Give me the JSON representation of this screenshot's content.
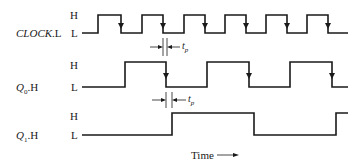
{
  "diagram": {
    "type": "timing-diagram",
    "signals": [
      {
        "name": "CLOCK.L",
        "name_italic": "CLOCK",
        "name_suffix": ".L",
        "high_label": "H",
        "low_label": "L",
        "edges_x": [
          98,
          121,
          142,
          163,
          184,
          205,
          225,
          246,
          266,
          287,
          307,
          328
        ],
        "start_level": "L"
      },
      {
        "name": "Q0.H",
        "name_italic": "Q",
        "name_sub": "0",
        "name_suffix": ".H",
        "high_label": "H",
        "low_label": "L",
        "edges_x": [
          125,
          166,
          207,
          249,
          290,
          332
        ],
        "start_level": "L"
      },
      {
        "name": "Q1.H",
        "name_italic": "Q",
        "name_sub": "1",
        "name_suffix": ".H",
        "high_label": "H",
        "low_label": "L",
        "edges_x": [
          172,
          254,
          336
        ],
        "start_level": "L"
      }
    ],
    "annotations": {
      "tp1": "t",
      "tp1_sub": "p",
      "tp2": "t",
      "tp2_sub": "p"
    },
    "axis": {
      "time_label": "Time"
    }
  }
}
